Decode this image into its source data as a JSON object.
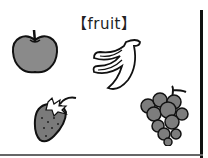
{
  "title": "【fruit】",
  "fruits": [
    {
      "name": "apple",
      "color": "#8a8a8a"
    },
    {
      "name": "banana",
      "color": "#ffffff"
    },
    {
      "name": "strawberry",
      "color": "#7a7a7a"
    },
    {
      "name": "grapes",
      "color": "#7d7d7d"
    }
  ]
}
